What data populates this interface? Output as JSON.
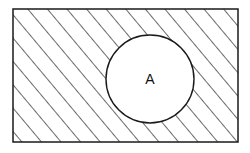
{
  "diagram": {
    "type": "venn",
    "set_label": "A",
    "shaded_region": "complement of A",
    "colors": {
      "stroke": "#1a1a1a",
      "background": "#ffffff"
    }
  }
}
